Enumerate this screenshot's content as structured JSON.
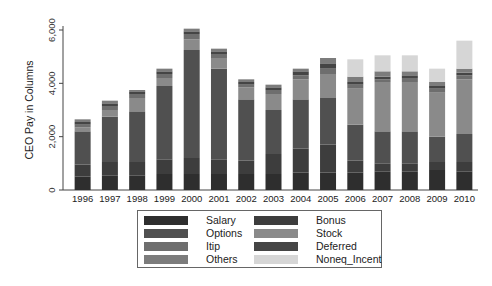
{
  "chart_data": {
    "type": "bar",
    "stacked": true,
    "title": "",
    "xlabel": "",
    "ylabel": "CEO Pay in Columns",
    "ylim": [
      0,
      6000
    ],
    "yticks": [
      0,
      2000,
      4000,
      6000
    ],
    "ytick_labels": [
      "0",
      "2,000",
      "4,000",
      "6,000"
    ],
    "grid": false,
    "legend_position": "bottom",
    "categories": [
      "1996",
      "1997",
      "1998",
      "1999",
      "2000",
      "2001",
      "2002",
      "2003",
      "2004",
      "2005",
      "2006",
      "2007",
      "2008",
      "2009",
      "2010"
    ],
    "series": [
      {
        "name": "Salary",
        "color": "#2e2e2e",
        "values": [
          500,
          550,
          550,
          600,
          600,
          600,
          600,
          600,
          650,
          650,
          650,
          700,
          700,
          750,
          700
        ]
      },
      {
        "name": "Bonus",
        "color": "#3d3d3d",
        "values": [
          450,
          500,
          500,
          550,
          600,
          550,
          500,
          750,
          900,
          1050,
          450,
          300,
          300,
          300,
          350
        ]
      },
      {
        "name": "Options",
        "color": "#505050",
        "values": [
          1250,
          1700,
          1900,
          2750,
          4050,
          3400,
          2300,
          1650,
          1850,
          1750,
          1350,
          1200,
          1200,
          950,
          1050
        ]
      },
      {
        "name": "Stock",
        "color": "#8a8a8a",
        "values": [
          150,
          250,
          500,
          300,
          400,
          400,
          450,
          600,
          750,
          900,
          1350,
          1850,
          1850,
          1650,
          2050
        ]
      },
      {
        "name": "Itip",
        "color": "#6e6e6e",
        "values": [
          100,
          150,
          150,
          150,
          200,
          150,
          100,
          150,
          150,
          200,
          150,
          100,
          150,
          150,
          150
        ]
      },
      {
        "name": "Deferred",
        "color": "#454545",
        "values": [
          100,
          100,
          100,
          100,
          100,
          100,
          100,
          100,
          150,
          200,
          100,
          100,
          100,
          100,
          100
        ]
      },
      {
        "name": "Others",
        "color": "#7c7c7c",
        "values": [
          100,
          100,
          50,
          100,
          100,
          100,
          100,
          100,
          100,
          200,
          200,
          200,
          150,
          150,
          150
        ]
      },
      {
        "name": "Noneq_Incent",
        "color": "#d6d6d6",
        "values": [
          0,
          0,
          0,
          0,
          0,
          0,
          0,
          0,
          0,
          0,
          650,
          600,
          600,
          500,
          1050
        ]
      }
    ],
    "legend_entries": [
      "Salary",
      "Bonus",
      "Options",
      "Stock",
      "Itip",
      "Deferred",
      "Others",
      "Noneq_Incent"
    ]
  },
  "stack_order": [
    "Salary",
    "Bonus",
    "Options",
    "Stock",
    "Itip",
    "Deferred",
    "Others",
    "Noneq_Incent"
  ]
}
